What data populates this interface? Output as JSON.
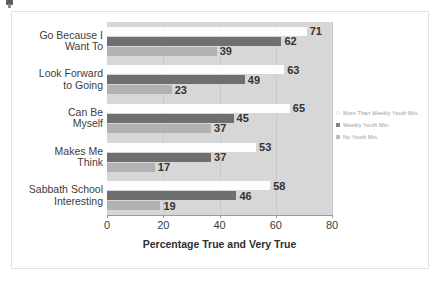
{
  "chart_data": {
    "type": "bar",
    "orientation": "horizontal",
    "title": "",
    "xlabel": "Percentage True and Very True",
    "ylabel": "",
    "xlim": [
      0,
      80
    ],
    "xticks": [
      0,
      20,
      40,
      60,
      80
    ],
    "grid": true,
    "legend_position": "right",
    "categories": [
      "Go Because I Want To",
      "Look Forward to Going",
      "Can Be Myself",
      "Makes Me Think",
      "Sabbath School Interesting"
    ],
    "category_lines": [
      [
        "Go Because I",
        "Want To"
      ],
      [
        "Look Forward",
        "to Going"
      ],
      [
        "Can Be",
        "Myself"
      ],
      [
        "Makes Me",
        "Think"
      ],
      [
        "Sabbath School",
        "Interesting"
      ]
    ],
    "series": [
      {
        "name": "More Than Weekly Youth Min.",
        "color": "#fdfdfd",
        "values": [
          71,
          63,
          65,
          53,
          58
        ]
      },
      {
        "name": "Weekly Youth Min.",
        "color": "#6f6f6f",
        "values": [
          62,
          49,
          45,
          37,
          46
        ]
      },
      {
        "name": "No Youth Min.",
        "color": "#b2b2b2",
        "values": [
          39,
          23,
          37,
          17,
          19
        ]
      }
    ]
  },
  "colors": {
    "plot_background": "#d7d7d7",
    "gridline": "#c9c9c9",
    "axis": "#9a9a9a",
    "frame": "#e2e2e2",
    "label_text": "#3d3d3d",
    "legend_text": "#9b9b9b"
  }
}
